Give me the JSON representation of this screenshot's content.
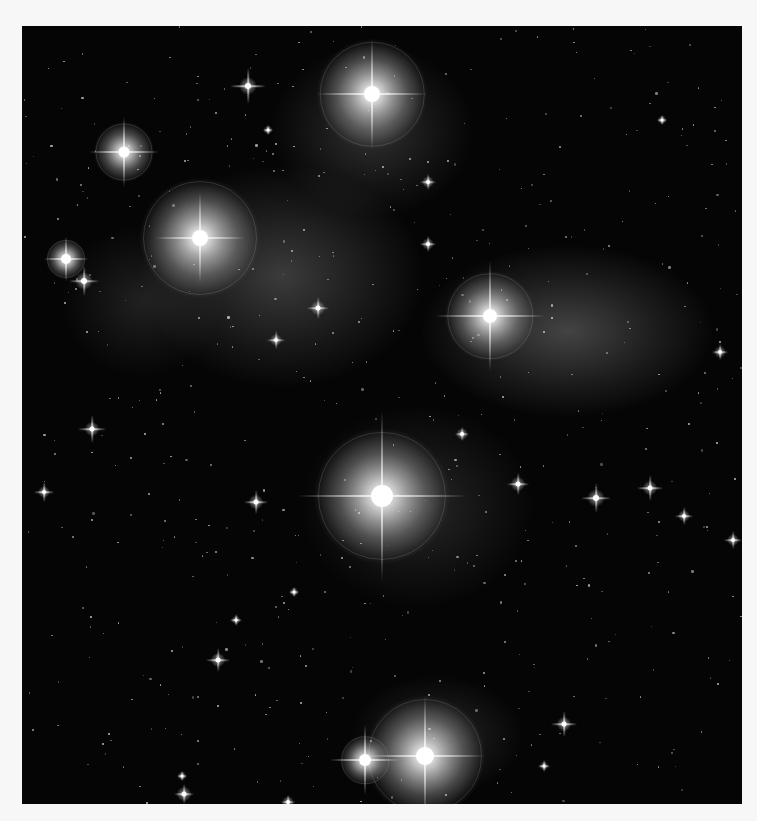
{
  "image": {
    "subject": "Pleiades star cluster with reflection nebulae (grayscale photograph)",
    "frame": {
      "left": 22,
      "top": 26,
      "width": 720,
      "height": 778
    },
    "colors": {
      "page": "#f7f7f7",
      "sky": "#050505",
      "star": "#ffffff",
      "nebula": "#bdbdbd"
    }
  },
  "nebulae": [
    {
      "x": 120,
      "y": 140,
      "w": 280,
      "h": 220,
      "opacity": 0.28
    },
    {
      "x": 400,
      "y": 220,
      "w": 290,
      "h": 170,
      "opacity": 0.32
    },
    {
      "x": 250,
      "y": 20,
      "w": 200,
      "h": 170,
      "opacity": 0.22
    },
    {
      "x": 280,
      "y": 380,
      "w": 230,
      "h": 200,
      "opacity": 0.18
    },
    {
      "x": 40,
      "y": 200,
      "w": 160,
      "h": 150,
      "opacity": 0.14
    },
    {
      "x": 330,
      "y": 650,
      "w": 170,
      "h": 120,
      "opacity": 0.18
    }
  ],
  "bright_stars": [
    {
      "name": "Alcyone",
      "x": 360,
      "y": 470,
      "core": 22,
      "halo": 135,
      "spike": 170
    },
    {
      "name": "Merope",
      "x": 350,
      "y": 68,
      "core": 16,
      "halo": 110,
      "spike": 110
    },
    {
      "name": "Electra",
      "x": 178,
      "y": 212,
      "core": 16,
      "halo": 120,
      "spike": 90
    },
    {
      "name": "Maia",
      "x": 468,
      "y": 290,
      "core": 14,
      "halo": 90,
      "spike": 110
    },
    {
      "name": "Atlas",
      "x": 403,
      "y": 730,
      "core": 18,
      "halo": 120,
      "spike": 120
    },
    {
      "name": "Pleione",
      "x": 343,
      "y": 734,
      "core": 12,
      "halo": 50,
      "spike": 70
    },
    {
      "name": "Taygeta",
      "x": 102,
      "y": 126,
      "core": 11,
      "halo": 60,
      "spike": 70
    },
    {
      "name": "Celaeno",
      "x": 44,
      "y": 233,
      "core": 10,
      "halo": 40,
      "spike": 45
    }
  ],
  "medium_stars": [
    {
      "x": 226,
      "y": 60,
      "size": 6,
      "spike": 36
    },
    {
      "x": 62,
      "y": 255,
      "size": 6,
      "spike": 30
    },
    {
      "x": 296,
      "y": 282,
      "size": 5,
      "spike": 22
    },
    {
      "x": 70,
      "y": 403,
      "size": 5,
      "spike": 28
    },
    {
      "x": 22,
      "y": 466,
      "size": 4,
      "spike": 20
    },
    {
      "x": 254,
      "y": 314,
      "size": 4,
      "spike": 18
    },
    {
      "x": 234,
      "y": 476,
      "size": 5,
      "spike": 24
    },
    {
      "x": 496,
      "y": 458,
      "size": 5,
      "spike": 22
    },
    {
      "x": 574,
      "y": 472,
      "size": 6,
      "spike": 30
    },
    {
      "x": 628,
      "y": 462,
      "size": 5,
      "spike": 26
    },
    {
      "x": 662,
      "y": 490,
      "size": 4,
      "spike": 18
    },
    {
      "x": 711,
      "y": 514,
      "size": 4,
      "spike": 18
    },
    {
      "x": 698,
      "y": 326,
      "size": 4,
      "spike": 16
    },
    {
      "x": 196,
      "y": 634,
      "size": 5,
      "spike": 24
    },
    {
      "x": 542,
      "y": 698,
      "size": 5,
      "spike": 26
    },
    {
      "x": 406,
      "y": 218,
      "size": 4,
      "spike": 16
    },
    {
      "x": 406,
      "y": 156,
      "size": 4,
      "spike": 16
    },
    {
      "x": 440,
      "y": 408,
      "size": 4,
      "spike": 14
    },
    {
      "x": 162,
      "y": 768,
      "size": 5,
      "spike": 20
    },
    {
      "x": 214,
      "y": 594,
      "size": 3,
      "spike": 12
    },
    {
      "x": 522,
      "y": 740,
      "size": 3,
      "spike": 12
    },
    {
      "x": 640,
      "y": 94,
      "size": 3,
      "spike": 10
    },
    {
      "x": 246,
      "y": 104,
      "size": 3,
      "spike": 10
    },
    {
      "x": 272,
      "y": 566,
      "size": 3,
      "spike": 10
    },
    {
      "x": 160,
      "y": 750,
      "size": 3,
      "spike": 10
    },
    {
      "x": 266,
      "y": 776,
      "size": 4,
      "spike": 14
    }
  ],
  "faint_stars_seed": 1337,
  "faint_stars_count": 520
}
